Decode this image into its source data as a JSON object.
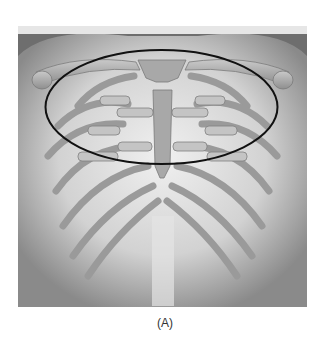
{
  "figure": {
    "highlight": {
      "shape": "ellipse",
      "stroke_color": "#111111"
    },
    "colors": {
      "background": "#7a7a7a",
      "skin": "#d8d8d8",
      "bone": "#b9b9b9",
      "bone_dark": "#8c8c8c"
    }
  },
  "caption": {
    "label": "(A)"
  }
}
